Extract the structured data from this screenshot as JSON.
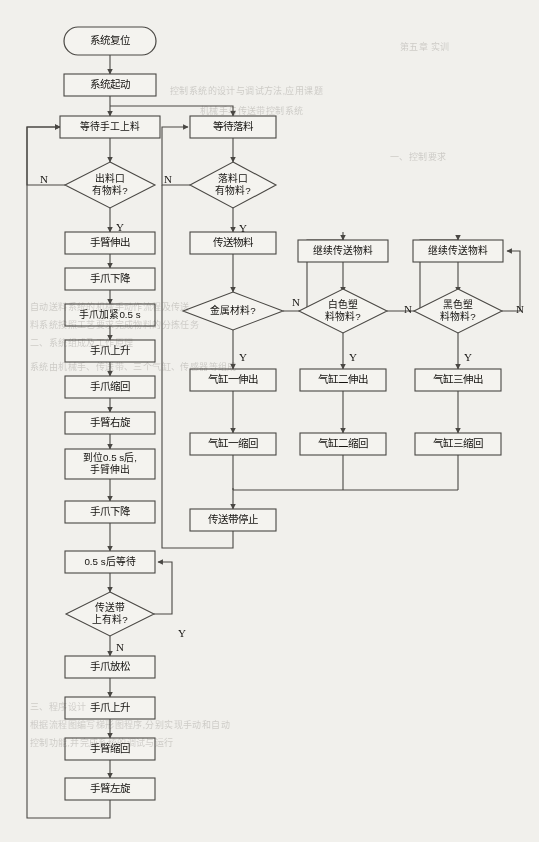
{
  "chart_data": {
    "type": "diagram",
    "nodes": [
      {
        "id": "n1",
        "kind": "terminator",
        "label": "系统复位",
        "x": 110,
        "y": 41,
        "w": 92,
        "h": 28
      },
      {
        "id": "n2",
        "kind": "process",
        "label": "系统起动",
        "x": 110,
        "y": 85,
        "w": 92,
        "h": 22
      },
      {
        "id": "n3",
        "kind": "process",
        "label": "等待手工上料",
        "x": 110,
        "y": 127,
        "w": 100,
        "h": 22
      },
      {
        "id": "n4",
        "kind": "decision",
        "label": "出料口\n有物料?",
        "x": 110,
        "y": 185,
        "w": 90,
        "h": 46
      },
      {
        "id": "n5",
        "kind": "process",
        "label": "手臂伸出",
        "x": 110,
        "y": 243,
        "w": 90,
        "h": 22
      },
      {
        "id": "n6",
        "kind": "process",
        "label": "手爪下降",
        "x": 110,
        "y": 279,
        "w": 90,
        "h": 22
      },
      {
        "id": "n7",
        "kind": "process",
        "label": "手爪加紧0.5 s",
        "x": 110,
        "y": 315,
        "w": 90,
        "h": 22
      },
      {
        "id": "n8",
        "kind": "process",
        "label": "手爪上升",
        "x": 110,
        "y": 351,
        "w": 90,
        "h": 22
      },
      {
        "id": "n9",
        "kind": "process",
        "label": "手爪缩回",
        "x": 110,
        "y": 387,
        "w": 90,
        "h": 22
      },
      {
        "id": "n10",
        "kind": "process",
        "label": "手臂右旋",
        "x": 110,
        "y": 423,
        "w": 90,
        "h": 22
      },
      {
        "id": "n11",
        "kind": "process",
        "label": "到位0.5 s后,\n手臂伸出",
        "x": 110,
        "y": 464,
        "w": 90,
        "h": 30
      },
      {
        "id": "n12",
        "kind": "process",
        "label": "手爪下降",
        "x": 110,
        "y": 512,
        "w": 90,
        "h": 22
      },
      {
        "id": "n13",
        "kind": "process",
        "label": "0.5 s后等待",
        "x": 110,
        "y": 562,
        "w": 90,
        "h": 22
      },
      {
        "id": "n14",
        "kind": "decision",
        "label": "传送带\n上有料?",
        "x": 110,
        "y": 614,
        "w": 88,
        "h": 44
      },
      {
        "id": "n15",
        "kind": "process",
        "label": "手爪放松",
        "x": 110,
        "y": 667,
        "w": 90,
        "h": 22
      },
      {
        "id": "n16",
        "kind": "process",
        "label": "手爪上升",
        "x": 110,
        "y": 708,
        "w": 90,
        "h": 22
      },
      {
        "id": "n17",
        "kind": "process",
        "label": "手臂缩回",
        "x": 110,
        "y": 749,
        "w": 90,
        "h": 22
      },
      {
        "id": "n18",
        "kind": "process",
        "label": "手臂左旋",
        "x": 110,
        "y": 789,
        "w": 90,
        "h": 22
      },
      {
        "id": "r1",
        "kind": "process",
        "label": "等待落料",
        "x": 233,
        "y": 127,
        "w": 86,
        "h": 22
      },
      {
        "id": "r2",
        "kind": "decision",
        "label": "落料口\n有物料?",
        "x": 233,
        "y": 185,
        "w": 86,
        "h": 46
      },
      {
        "id": "r3",
        "kind": "process",
        "label": "传送物料",
        "x": 233,
        "y": 243,
        "w": 86,
        "h": 22
      },
      {
        "id": "r4",
        "kind": "decision",
        "label": "金属材料?",
        "x": 233,
        "y": 311,
        "w": 100,
        "h": 38
      },
      {
        "id": "r5",
        "kind": "process",
        "label": "气缸一伸出",
        "x": 233,
        "y": 380,
        "w": 86,
        "h": 22
      },
      {
        "id": "r6",
        "kind": "process",
        "label": "气缸一缩回",
        "x": 233,
        "y": 444,
        "w": 86,
        "h": 22
      },
      {
        "id": "r7",
        "kind": "process",
        "label": "传送带停止",
        "x": 233,
        "y": 520,
        "w": 86,
        "h": 22
      },
      {
        "id": "c1",
        "kind": "process",
        "label": "继续传送物料",
        "x": 343,
        "y": 251,
        "w": 90,
        "h": 22
      },
      {
        "id": "c2",
        "kind": "decision",
        "label": "白色塑\n料物料?",
        "x": 343,
        "y": 311,
        "w": 88,
        "h": 44
      },
      {
        "id": "c3",
        "kind": "process",
        "label": "气缸二伸出",
        "x": 343,
        "y": 380,
        "w": 86,
        "h": 22
      },
      {
        "id": "c4",
        "kind": "process",
        "label": "气缸二缩回",
        "x": 343,
        "y": 444,
        "w": 86,
        "h": 22
      },
      {
        "id": "d1",
        "kind": "process",
        "label": "继续传送物料",
        "x": 458,
        "y": 251,
        "w": 90,
        "h": 22
      },
      {
        "id": "d2",
        "kind": "decision",
        "label": "黑色塑\n料物料?",
        "x": 458,
        "y": 311,
        "w": 88,
        "h": 44
      },
      {
        "id": "d3",
        "kind": "process",
        "label": "气缸三伸出",
        "x": 458,
        "y": 380,
        "w": 86,
        "h": 22
      },
      {
        "id": "d4",
        "kind": "process",
        "label": "气缸三缩回",
        "x": 458,
        "y": 444,
        "w": 86,
        "h": 22
      }
    ],
    "branch_labels": [
      {
        "id": "bl1",
        "text": "N",
        "x": 44,
        "y": 180
      },
      {
        "id": "bl2",
        "text": "Y",
        "x": 120,
        "y": 228
      },
      {
        "id": "bl3",
        "text": "N",
        "x": 120,
        "y": 648
      },
      {
        "id": "bl4",
        "text": "Y",
        "x": 182,
        "y": 634
      },
      {
        "id": "bl5",
        "text": "N",
        "x": 168,
        "y": 180
      },
      {
        "id": "bl6",
        "text": "Y",
        "x": 243,
        "y": 358
      },
      {
        "id": "bl7",
        "text": "N",
        "x": 296,
        "y": 303
      },
      {
        "id": "bl8",
        "text": "Y",
        "x": 243,
        "y": 229
      },
      {
        "id": "bl9",
        "text": "Y",
        "x": 353,
        "y": 358
      },
      {
        "id": "bl10",
        "text": "N",
        "x": 408,
        "y": 310
      },
      {
        "id": "bl11",
        "text": "Y",
        "x": 468,
        "y": 358
      },
      {
        "id": "bl12",
        "text": "N",
        "x": 520,
        "y": 310
      }
    ],
    "edges": [
      {
        "from": "系统复位",
        "to": "系统起动",
        "label": ""
      },
      {
        "from": "系统起动",
        "to": "等待手工上料",
        "label": ""
      },
      {
        "from": "系统起动",
        "to": "等待落料",
        "label": ""
      },
      {
        "from": "等待手工上料",
        "to": "出料口有物料?",
        "label": ""
      },
      {
        "from": "出料口有物料?",
        "to": "等待手工上料",
        "label": "N"
      },
      {
        "from": "出料口有物料?",
        "to": "手臂伸出",
        "label": "Y"
      },
      {
        "from": "手臂伸出",
        "to": "手爪下降",
        "label": ""
      },
      {
        "from": "手爪下降",
        "to": "手爪加紧0.5 s",
        "label": ""
      },
      {
        "from": "手爪加紧0.5 s",
        "to": "手爪上升",
        "label": ""
      },
      {
        "from": "手爪上升",
        "to": "手爪缩回",
        "label": ""
      },
      {
        "from": "手爪缩回",
        "to": "手臂右旋",
        "label": ""
      },
      {
        "from": "手臂右旋",
        "to": "到位0.5 s后,手臂伸出",
        "label": ""
      },
      {
        "from": "到位0.5 s后,手臂伸出",
        "to": "手爪下降",
        "label": ""
      },
      {
        "from": "手爪下降",
        "to": "0.5 s后等待",
        "label": ""
      },
      {
        "from": "0.5 s后等待",
        "to": "传送带上有料?",
        "label": ""
      },
      {
        "from": "传送带上有料?",
        "to": "0.5 s后等待",
        "label": "Y"
      },
      {
        "from": "传送带上有料?",
        "to": "手爪放松",
        "label": "N"
      },
      {
        "from": "手爪放松",
        "to": "手爪上升",
        "label": ""
      },
      {
        "from": "手爪上升",
        "to": "手臂缩回",
        "label": ""
      },
      {
        "from": "手臂缩回",
        "to": "手臂左旋",
        "label": ""
      },
      {
        "from": "手臂左旋",
        "to": "等待手工上料",
        "label": ""
      },
      {
        "from": "等待落料",
        "to": "落料口有物料?",
        "label": ""
      },
      {
        "from": "落料口有物料?",
        "to": "等待落料",
        "label": "N"
      },
      {
        "from": "落料口有物料?",
        "to": "传送物料",
        "label": "Y"
      },
      {
        "from": "传送物料",
        "to": "金属材料?",
        "label": ""
      },
      {
        "from": "金属材料?",
        "to": "气缸一伸出",
        "label": "Y"
      },
      {
        "from": "金属材料?",
        "to": "继续传送物料(二)",
        "label": "N"
      },
      {
        "from": "气缸一伸出",
        "to": "气缸一缩回",
        "label": ""
      },
      {
        "from": "气缸一缩回",
        "to": "传送带停止",
        "label": ""
      },
      {
        "from": "继续传送物料(二)",
        "to": "白色塑料物料?",
        "label": ""
      },
      {
        "from": "白色塑料物料?",
        "to": "气缸二伸出",
        "label": "Y"
      },
      {
        "from": "白色塑料物料?",
        "to": "继续传送物料(三)",
        "label": "N"
      },
      {
        "from": "气缸二伸出",
        "to": "气缸二缩回",
        "label": ""
      },
      {
        "from": "气缸二缩回",
        "to": "传送带停止",
        "label": ""
      },
      {
        "from": "继续传送物料(三)",
        "to": "黑色塑料物料?",
        "label": ""
      },
      {
        "from": "黑色塑料物料?",
        "to": "气缸三伸出",
        "label": "Y"
      },
      {
        "from": "黑色塑料物料?",
        "to": "继续传送物料(三)",
        "label": "N"
      },
      {
        "from": "气缸三伸出",
        "to": "气缸三缩回",
        "label": ""
      },
      {
        "from": "气缸三缩回",
        "to": "传送带停止",
        "label": ""
      },
      {
        "from": "传送带停止",
        "to": "等待落料",
        "label": ""
      }
    ],
    "colors": {
      "page_background": "#f4f3ef",
      "node_fill": "#f7f6f2",
      "stroke": "#4a4844",
      "text": "#14120f"
    }
  },
  "ghost_text": {
    "lines": [
      {
        "t": "第五章 实训",
        "x": 400,
        "y": 40
      },
      {
        "t": "控制系统的设计与调试方法,应用课题",
        "x": 170,
        "y": 84
      },
      {
        "t": "机械手与传送带控制系统",
        "x": 200,
        "y": 104
      },
      {
        "t": "一、控制要求",
        "x": 390,
        "y": 150
      },
      {
        "t": "自动送料系统的机械手动作流程及传送",
        "x": 30,
        "y": 300
      },
      {
        "t": "料系统按照工艺要求完成物料的分拣任务",
        "x": 30,
        "y": 318
      },
      {
        "t": "二、系统组成及工作原理",
        "x": 30,
        "y": 336
      },
      {
        "t": "系统由机械手、传送带、三个气缸、传感器等组成",
        "x": 30,
        "y": 360
      },
      {
        "t": "三、程序设计",
        "x": 30,
        "y": 700
      },
      {
        "t": "根据流程图编写梯形图程序,分别实现手动和自动",
        "x": 30,
        "y": 718
      },
      {
        "t": "控制功能,并完成系统的调试与运行",
        "x": 30,
        "y": 736
      }
    ]
  }
}
